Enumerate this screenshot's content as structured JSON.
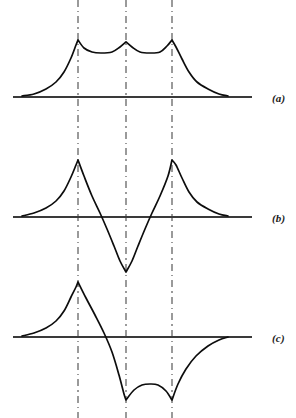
{
  "figure": {
    "width": 296,
    "height": 418,
    "background_color": "#ffffff",
    "curve_color": "#0d0d0d",
    "axis_color": "#3a3a3a",
    "guide_color": "#9a9a9a",
    "guide_style": "dash-dot"
  },
  "guides": {
    "label": "vertical dash-dot reference lines",
    "x_positions": [
      78,
      126,
      172
    ],
    "y_top": 0,
    "y_bottom": 418
  },
  "panels": [
    {
      "id": "a",
      "label": "(a)",
      "label_x": 272,
      "label_y": 92,
      "axis_y": 97,
      "axis_x_start": 13,
      "axis_x_end": 252,
      "description": "three upward cusps sitting above the baseline with decaying tails on both sides",
      "cusp_peaks_y": [
        40,
        42,
        40
      ],
      "arc_dip_y": 52,
      "tail_left_x": 22,
      "tail_right_x": 228
    },
    {
      "id": "b",
      "label": "(b)",
      "label_x": 272,
      "label_y": 212,
      "axis_y": 217,
      "axis_x_start": 13,
      "axis_x_end": 252,
      "description": "two upward cusps flanking a deep downward cusp that crosses the baseline",
      "cusp_peaks_y": [
        160,
        160
      ],
      "cusp_trough_y": 272,
      "tail_left_x": 22,
      "tail_right_x": 228
    },
    {
      "id": "c",
      "label": "(c)",
      "label_x": 272,
      "label_y": 332,
      "axis_y": 337,
      "axis_x_start": 13,
      "axis_x_end": 252,
      "description": "one upward cusp followed by two downward cusps joined by a concave-up arc, with a rising tail",
      "cusp_peak_y": 282,
      "cusp_trough_y": 400,
      "arc_rise_y": 384,
      "tail_left_x": 22,
      "tail_right_x": 228
    }
  ],
  "chart_data": {
    "type": "line",
    "xlabel": "",
    "ylabel": "",
    "grid": false,
    "legend": null,
    "annotations": [
      "(a)",
      "(b)",
      "(c)"
    ],
    "axis_x_range": [
      13,
      252
    ],
    "vertical_reference_lines": [
      78,
      126,
      172
    ],
    "series": [
      {
        "name": "(a)",
        "panel": "a",
        "baseline_y": 97,
        "points": [
          [
            22,
            96
          ],
          [
            34,
            94
          ],
          [
            46,
            89
          ],
          [
            56,
            82
          ],
          [
            64,
            72
          ],
          [
            71,
            58
          ],
          [
            76,
            45
          ],
          [
            78,
            40
          ],
          [
            84,
            48
          ],
          [
            92,
            52
          ],
          [
            101,
            53
          ],
          [
            112,
            52
          ],
          [
            120,
            47
          ],
          [
            126,
            42
          ],
          [
            132,
            47
          ],
          [
            140,
            52
          ],
          [
            150,
            53
          ],
          [
            160,
            52
          ],
          [
            167,
            46
          ],
          [
            172,
            40
          ],
          [
            176,
            47
          ],
          [
            182,
            59
          ],
          [
            189,
            72
          ],
          [
            197,
            82
          ],
          [
            208,
            89
          ],
          [
            219,
            94
          ],
          [
            228,
            96
          ]
        ]
      },
      {
        "name": "(b)",
        "panel": "b",
        "baseline_y": 217,
        "points": [
          [
            22,
            216
          ],
          [
            34,
            213
          ],
          [
            46,
            208
          ],
          [
            56,
            201
          ],
          [
            64,
            191
          ],
          [
            71,
            177
          ],
          [
            76,
            165
          ],
          [
            78,
            160
          ],
          [
            84,
            176
          ],
          [
            92,
            196
          ],
          [
            100,
            213
          ],
          [
            107,
            229
          ],
          [
            114,
            246
          ],
          [
            120,
            261
          ],
          [
            126,
            272
          ],
          [
            132,
            261
          ],
          [
            138,
            246
          ],
          [
            145,
            229
          ],
          [
            152,
            213
          ],
          [
            160,
            196
          ],
          [
            168,
            176
          ],
          [
            172,
            160
          ],
          [
            176,
            165
          ],
          [
            182,
            178
          ],
          [
            189,
            192
          ],
          [
            197,
            202
          ],
          [
            208,
            209
          ],
          [
            219,
            214
          ],
          [
            228,
            216
          ]
        ]
      },
      {
        "name": "(c)",
        "panel": "c",
        "baseline_y": 337,
        "points": [
          [
            22,
            336
          ],
          [
            34,
            333
          ],
          [
            46,
            328
          ],
          [
            56,
            321
          ],
          [
            64,
            311
          ],
          [
            71,
            297
          ],
          [
            76,
            287
          ],
          [
            78,
            282
          ],
          [
            86,
            298
          ],
          [
            95,
            315
          ],
          [
            104,
            333
          ],
          [
            112,
            352
          ],
          [
            119,
            375
          ],
          [
            124,
            394
          ],
          [
            126,
            400
          ],
          [
            134,
            390
          ],
          [
            142,
            385
          ],
          [
            150,
            384
          ],
          [
            158,
            385
          ],
          [
            166,
            391
          ],
          [
            172,
            400
          ],
          [
            178,
            384
          ],
          [
            186,
            369
          ],
          [
            196,
            356
          ],
          [
            208,
            346
          ],
          [
            219,
            340
          ],
          [
            228,
            337
          ]
        ]
      }
    ]
  }
}
